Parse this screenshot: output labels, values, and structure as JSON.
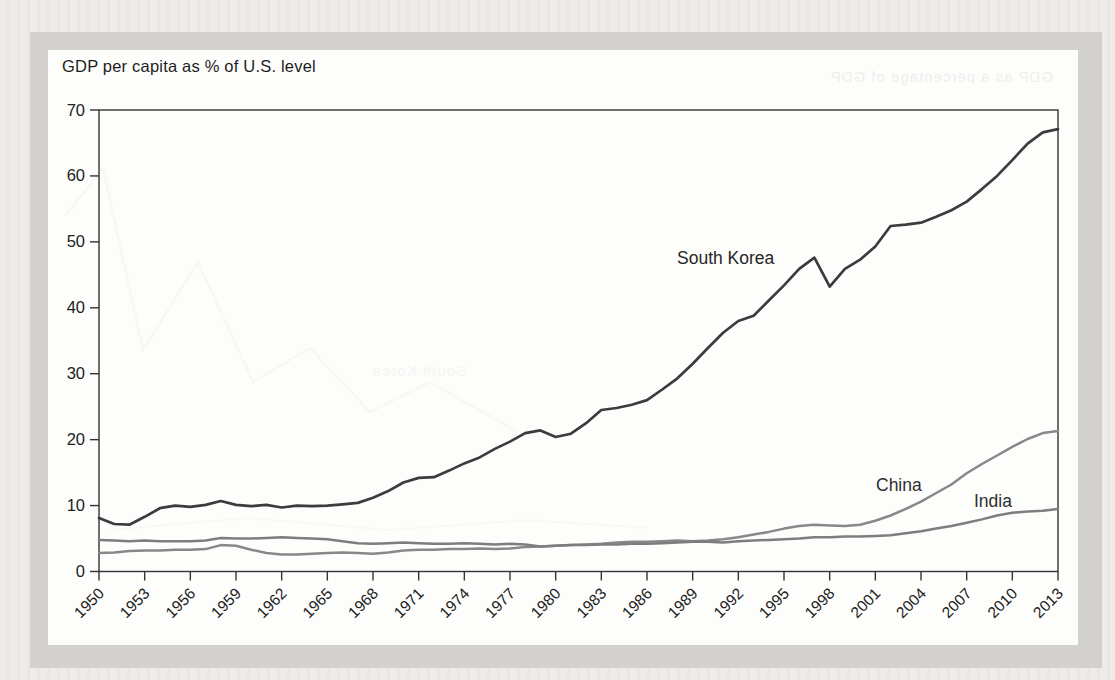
{
  "page": {
    "background_color": "#eae9e6",
    "frame_color": "#d2d1ce",
    "card_color": "#fdfdfb",
    "axis_color": "#333333",
    "text_color": "#1d1d1d"
  },
  "ghosts": {
    "top_text": "GDP as a percentage of GDP",
    "mid_text": "South Korea"
  },
  "chart_data": {
    "type": "line",
    "title": "GDP per capita as % of U.S. level",
    "xlabel": "",
    "ylabel": "",
    "x_range": [
      1950,
      2013
    ],
    "x_step": 1,
    "ylim": [
      0,
      70
    ],
    "grid": false,
    "legend": "inline-labels",
    "x_tick_labels": [
      "1950",
      "1953",
      "1956",
      "1959",
      "1962",
      "1965",
      "1968",
      "1971",
      "1974",
      "1977",
      "1980",
      "1983",
      "1986",
      "1989",
      "1992",
      "1995",
      "1998",
      "2001",
      "2004",
      "2007",
      "2010",
      "2013"
    ],
    "y_tick_labels": [
      "70",
      "60",
      "50",
      "40",
      "30",
      "20",
      "10",
      "0"
    ],
    "series": [
      {
        "name": "South Korea",
        "color": "#3c3c3c",
        "line_width": 2.7,
        "label_x": 629,
        "label_y": 214,
        "label_color": "#262626",
        "values": [
          8.1,
          7.2,
          7.1,
          8.3,
          9.6,
          10.0,
          9.8,
          10.1,
          10.7,
          10.1,
          9.9,
          10.1,
          9.7,
          10.0,
          9.9,
          10.0,
          10.2,
          10.4,
          11.2,
          12.2,
          13.5,
          14.2,
          14.3,
          15.3,
          16.4,
          17.3,
          18.6,
          19.7,
          21.0,
          21.4,
          20.4,
          20.9,
          22.5,
          24.5,
          24.8,
          25.3,
          26.0,
          27.6,
          29.3,
          31.5,
          33.9,
          36.2,
          38.0,
          38.8,
          41.1,
          43.4,
          45.9,
          47.6,
          43.2,
          45.9,
          47.3,
          49.3,
          52.4,
          52.6,
          52.9,
          53.8,
          54.8,
          56.1,
          58.0,
          60.0,
          62.4,
          64.9,
          66.6,
          67.1
        ]
      },
      {
        "name": "China",
        "color": "#888888",
        "line_width": 2.5,
        "label_x": 828,
        "label_y": 441,
        "label_color": "#2e2e2e",
        "values": [
          2.8,
          2.9,
          3.1,
          3.2,
          3.2,
          3.3,
          3.3,
          3.4,
          4.0,
          3.9,
          3.3,
          2.8,
          2.6,
          2.6,
          2.7,
          2.8,
          2.9,
          2.8,
          2.7,
          2.9,
          3.2,
          3.3,
          3.3,
          3.4,
          3.4,
          3.5,
          3.4,
          3.5,
          3.7,
          3.8,
          3.9,
          4.0,
          4.1,
          4.2,
          4.4,
          4.5,
          4.5,
          4.6,
          4.7,
          4.6,
          4.7,
          4.9,
          5.2,
          5.6,
          6.0,
          6.5,
          6.9,
          7.1,
          7.0,
          6.9,
          7.1,
          7.7,
          8.5,
          9.5,
          10.6,
          11.9,
          13.2,
          14.9,
          16.3,
          17.6,
          18.9,
          20.1,
          21.0,
          21.3
        ]
      },
      {
        "name": "India",
        "color": "#7d7d7d",
        "line_width": 2.5,
        "label_x": 926,
        "label_y": 457,
        "label_color": "#2e2e2e",
        "values": [
          4.8,
          4.7,
          4.6,
          4.7,
          4.6,
          4.6,
          4.6,
          4.7,
          5.1,
          5.0,
          5.0,
          5.1,
          5.2,
          5.1,
          5.0,
          4.9,
          4.6,
          4.3,
          4.2,
          4.3,
          4.4,
          4.3,
          4.2,
          4.2,
          4.3,
          4.2,
          4.1,
          4.2,
          4.1,
          3.8,
          3.9,
          4.0,
          4.0,
          4.1,
          4.1,
          4.2,
          4.2,
          4.3,
          4.4,
          4.5,
          4.5,
          4.4,
          4.6,
          4.7,
          4.8,
          4.9,
          5.0,
          5.2,
          5.2,
          5.3,
          5.3,
          5.4,
          5.5,
          5.8,
          6.1,
          6.5,
          6.9,
          7.4,
          7.9,
          8.5,
          8.9,
          9.1,
          9.2,
          9.5
        ]
      }
    ]
  }
}
